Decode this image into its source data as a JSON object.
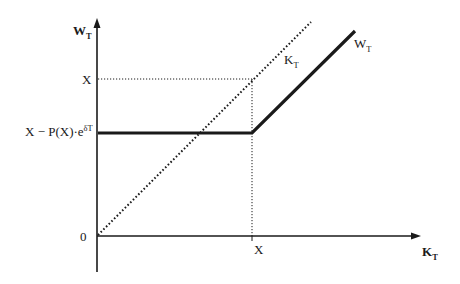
{
  "diagram": {
    "type": "payoff-diagram",
    "y_axis": {
      "label_main": "W",
      "label_sub": "T"
    },
    "x_axis": {
      "label_main": "K",
      "label_sub": "T"
    },
    "origin_label": "0",
    "x_tick_label": "X",
    "y_tick_upper": "X",
    "y_tick_lower": {
      "main": "X − P(X)·e",
      "sup": "δT"
    },
    "curves": [
      {
        "name": "K_T",
        "style": "dotted",
        "label_main": "K",
        "label_sub": "T"
      },
      {
        "name": "W_T",
        "style": "solid-thick",
        "label_main": "W",
        "label_sub": "T"
      }
    ],
    "colors": {
      "line": "#1a1a1a",
      "background": "#ffffff"
    }
  }
}
